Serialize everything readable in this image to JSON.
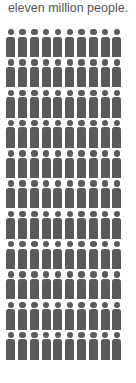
{
  "caption": "eleven million people.",
  "colors": {
    "figure": "#5a5a5a",
    "text": "#555555"
  },
  "chart_data": {
    "type": "pictograph",
    "title": "eleven million people.",
    "icon": "person-icon",
    "rows": 11,
    "columns": 10,
    "total_icons": 110,
    "legend": []
  }
}
